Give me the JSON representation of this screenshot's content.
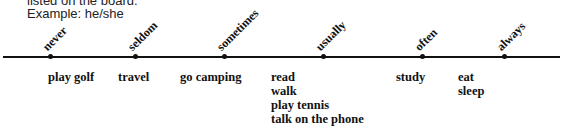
{
  "instructions": {
    "line1": "listed on the board.",
    "line2": "Example: he/she"
  },
  "scale": [
    {
      "label": "never",
      "x": 50,
      "activities": [
        "play golf"
      ]
    },
    {
      "label": "seldom",
      "x": 135,
      "activities": [
        "travel"
      ]
    },
    {
      "label": "sometimes",
      "x": 224,
      "activities": [
        "go camping"
      ]
    },
    {
      "label": "usually",
      "x": 323,
      "activities": [
        "read",
        "walk",
        "play tennis",
        "talk on the phone"
      ]
    },
    {
      "label": "often",
      "x": 422,
      "activities": [
        "study"
      ]
    },
    {
      "label": "always",
      "x": 504,
      "activities": [
        "eat",
        "sleep"
      ]
    }
  ]
}
